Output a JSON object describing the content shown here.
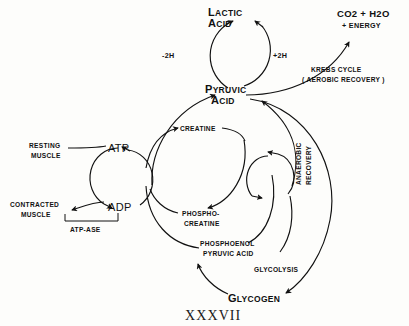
{
  "figure": {
    "caption": "XXXVII"
  },
  "nodes": {
    "lactic_acid": {
      "line1": "L",
      "line1_rest": "ACTIC",
      "line2": "A",
      "line2_rest": "CID",
      "full": "LACTIC ACID"
    },
    "pyruvic_acid": {
      "line1": "P",
      "line1_rest": "YRUVIC",
      "line2": "A",
      "line2_rest": "CID",
      "full": "PYRUVIC ACID"
    },
    "co2_water": {
      "line1": "CO2 + H2O",
      "line2": "+ ENERGY",
      "full": "CO2 + H2O + ENERGY"
    },
    "resting_muscle": {
      "line1": "RESTING",
      "line2": "MUSCLE",
      "full": "RESTING MUSCLE"
    },
    "contracted_muscle": {
      "line1": "CONTRACTED",
      "line2": "MUSCLE",
      "full": "CONTRACTED MUSCLE"
    },
    "atp": {
      "full": "ATP"
    },
    "adp": {
      "full": "ADP"
    },
    "creatine": {
      "full": "CREATINE"
    },
    "phosphocreatine": {
      "line1": "PHOSPHO-",
      "line2": "CREATINE",
      "full": "PHOSPHO-CREATINE"
    },
    "phosphoenol_pyruvic_acid": {
      "line1": "PHOSPHOENOL",
      "line2": "PYRUVIC ACID",
      "full": "PHOSPHOENOL PYRUVIC ACID"
    },
    "glycogen": {
      "line1": "G",
      "line1_rest": "LYCOGEN",
      "full": "GLYCOGEN"
    }
  },
  "edge_labels": {
    "minus_2h": "-2H",
    "plus_2h": "+2H",
    "krebs_cycle": "KREBS CYCLE",
    "aerobic_recovery": "( AEROBIC RECOVERY )",
    "anaerobic_recovery_line1": "ANAEROBIC",
    "anaerobic_recovery_line2": "RECOVERY",
    "glycolysis": "GLYCOLYSIS",
    "atp_ase": "ATP-ASE"
  },
  "colors": {
    "ink": "#111111",
    "background": "#fdfdfb"
  }
}
